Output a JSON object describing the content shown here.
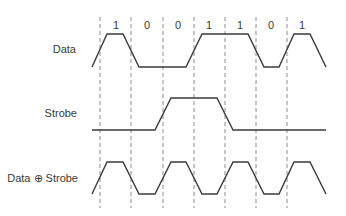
{
  "diagram": {
    "title": "",
    "colors": {
      "wave": "#3b3b3b",
      "grid": "#6f6f6f",
      "text": "#3a3a3a",
      "background": "#ffffff"
    },
    "bit_labels": [
      "1",
      "0",
      "0",
      "1",
      "1",
      "0",
      "1"
    ],
    "clock_boundaries_x": [
      100,
      131,
      163,
      194,
      225,
      256,
      287
    ],
    "signals": [
      {
        "name": "Data",
        "label": "Data",
        "levels": [
          1,
          0,
          0,
          1,
          1,
          0,
          1
        ],
        "points": "92,67 107,34 123,34 139,67 186,67 202,34 248,34 264,67 279,67 294,34 310,34 326,67"
      },
      {
        "name": "Strobe",
        "label": "Strobe",
        "levels": [
          0,
          0,
          1,
          1,
          0,
          0,
          0
        ],
        "points": "92,130 155,130 171,98 217,98 233,130 326,130"
      },
      {
        "name": "Data XOR Strobe",
        "label": "Data ⊕ Strobe",
        "levels": [
          1,
          0,
          1,
          0,
          1,
          0,
          1
        ],
        "points": "92,194 107,162 123,162 139,194 155,194 171,162 186,162 202,194 217,194 233,162 248,162 264,194 279,194 294,162 310,162 326,194"
      }
    ]
  }
}
